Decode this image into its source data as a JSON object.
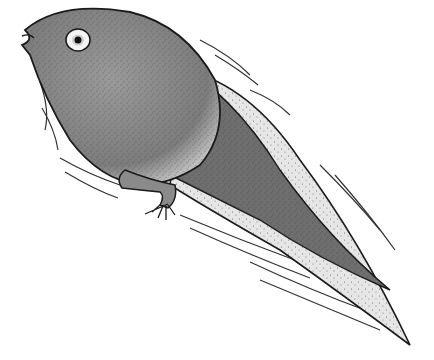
{
  "image": {
    "subject": "tadpole illustration",
    "colors": {
      "background": "#ffffff",
      "body": "#8a8a8a",
      "body_dark": "#6e6e6e",
      "outline": "#1a1a1a",
      "tail_fin": "#e6e6e6",
      "eye_white": "#f4f4f4",
      "pupil": "#111111"
    }
  }
}
